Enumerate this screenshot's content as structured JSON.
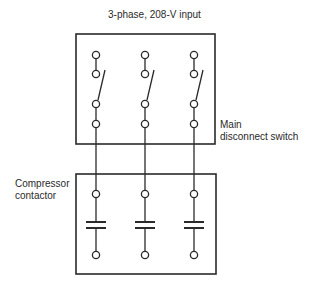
{
  "diagram": {
    "title": "3-phase, 208-V input",
    "labels": {
      "main_disconnect": [
        "Main",
        "disconnect switch"
      ],
      "compressor_contactor": [
        "Compressor",
        "contactor"
      ]
    },
    "phases": 3,
    "components": [
      {
        "name": "main-disconnect-switch",
        "type": "3-pole disconnect switch",
        "state": "open"
      },
      {
        "name": "compressor-contactor",
        "type": "3-pole contactor",
        "state": "open"
      }
    ],
    "colors": {
      "line": "#2a2a2a",
      "background": "#ffffff"
    }
  }
}
